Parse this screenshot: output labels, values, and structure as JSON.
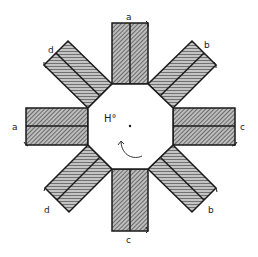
{
  "diagram": {
    "center_label": "H°",
    "rotation_indicator": "counter-clockwise curved arrow",
    "arms": [
      {
        "position": "top",
        "label": "a"
      },
      {
        "position": "top-right",
        "label": "b"
      },
      {
        "position": "right",
        "label": "c"
      },
      {
        "position": "bottom-right",
        "label": "b"
      },
      {
        "position": "bottom",
        "label": "c"
      },
      {
        "position": "bottom-left",
        "label": "d"
      },
      {
        "position": "left",
        "label": "a"
      },
      {
        "position": "top-left",
        "label": "d"
      }
    ],
    "colors": {
      "stroke": "#1a1a1a",
      "hatch": "#555555",
      "background": "#ffffff"
    }
  }
}
